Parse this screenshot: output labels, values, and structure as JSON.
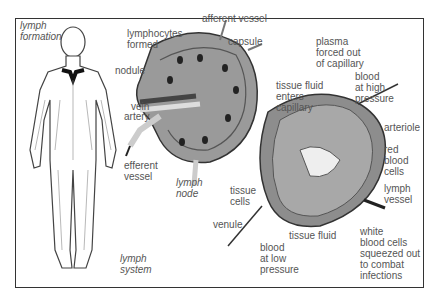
{
  "diagram": {
    "title_labels": {
      "lymph_formation": "lymph\nformation",
      "lymph_system": "lymph\nsystem",
      "lymph_node": "lymph\nnode"
    },
    "node_labels": {
      "lymphocytes_formed": "lymphocytes\nformed",
      "afferent_vessel": "afferent vessel",
      "capsule": "capsule",
      "nodule": "nodule",
      "vein": "vein",
      "artery": "artery",
      "efferent_vessel": "efferent\nvessel"
    },
    "capillary_labels": {
      "plasma": "plasma\nforced out\nof capillary",
      "tissue_fluid_enters": "tissue fluid\nenters\ncapillary",
      "blood_high": "blood\nat high\npressure",
      "arteriole": "arteriole",
      "red_blood_cells": "red\nblood\ncells",
      "lymph_vessel": "lymph\nvessel",
      "white_blood_cells": "white\nblood cells\nsqueezed out\nto combat\ninfections",
      "tissue_cells": "tissue\ncells",
      "venule": "venule",
      "tissue_fluid": "tissue fluid",
      "blood_low": "blood\nat low\npressure"
    }
  }
}
